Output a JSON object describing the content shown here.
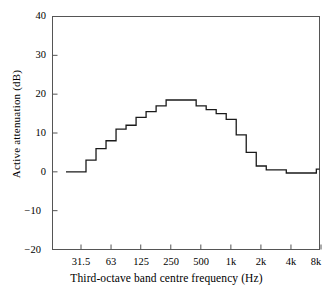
{
  "chart_data": {
    "type": "line",
    "style": "step",
    "title": "",
    "xlabel": "Third-octave band centre frequency  (Hz)",
    "ylabel": "Active attenuation  (dB)",
    "ylim": [
      -20,
      40
    ],
    "yticks": [
      -20,
      -10,
      0,
      10,
      20,
      30,
      40
    ],
    "ytick_labels": [
      "−20",
      "−10",
      "0",
      "10",
      "20",
      "30",
      "40"
    ],
    "xticks": [
      31.5,
      63,
      125,
      250,
      500,
      1000,
      2000,
      4000,
      8000
    ],
    "xtick_labels": [
      "31.5",
      "63",
      "125",
      "250",
      "500",
      "1k",
      "2k",
      "4k",
      "8k"
    ],
    "grid": false,
    "legend": false,
    "x_scale": "log",
    "categories": [
      "25",
      "31.5",
      "40",
      "50",
      "63",
      "80",
      "100",
      "125",
      "160",
      "200",
      "250",
      "315",
      "400",
      "500",
      "630",
      "800",
      "1k",
      "1.25k",
      "1.6k",
      "2k",
      "2.5k",
      "3.15k",
      "4k",
      "5k",
      "6.3k",
      "8k",
      "10k"
    ],
    "values": [
      0,
      0,
      3,
      6,
      8,
      11,
      12,
      14,
      15.5,
      17,
      18.5,
      18.5,
      18.5,
      17,
      16,
      15,
      13.5,
      9.5,
      5,
      1.5,
      0.5,
      0.5,
      -0.3,
      -0.3,
      -0.3,
      0.7,
      0.7
    ],
    "series": [
      {
        "name": "Active attenuation",
        "color": "#1a1a1a",
        "values": [
          0,
          0,
          3,
          6,
          8,
          11,
          12,
          14,
          15.5,
          17,
          18.5,
          18.5,
          18.5,
          17,
          16,
          15,
          13.5,
          9.5,
          5,
          1.5,
          0.5,
          0.5,
          -0.3,
          -0.3,
          -0.3,
          0.7,
          0.7
        ]
      }
    ],
    "peak_value": 18.5,
    "peak_band": "250",
    "frame_color": "#555555",
    "line_color": "#1a1a1a"
  }
}
